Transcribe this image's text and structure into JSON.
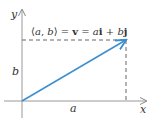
{
  "diagram": {
    "title_equation": {
      "open": "⟨",
      "a": "a",
      "comma": ", ",
      "b": "b",
      "close": "⟩",
      "eq1": " = ",
      "v": "v",
      "eq2": " = ",
      "ai_coef": "a",
      "i": "i",
      "plus": " + ",
      "bj_coef": "b",
      "j": "j"
    },
    "axes": {
      "x_label": "x",
      "y_label": "y"
    },
    "components": {
      "horizontal_label": "a",
      "vertical_label": "b"
    },
    "vector": {
      "from": [
        0,
        0
      ],
      "to": [
        "a",
        "b"
      ]
    },
    "colors": {
      "vector": "#3b8fd0",
      "axes": "#888888",
      "dashed": "#666666",
      "text": "#333333"
    }
  }
}
